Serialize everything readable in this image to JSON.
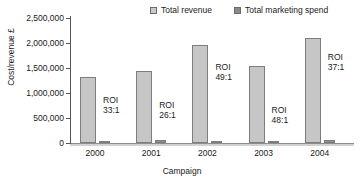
{
  "chart_data": {
    "type": "bar",
    "title": "",
    "xlabel": "Campaign",
    "ylabel": "Cost/revenue £",
    "categories": [
      "2000",
      "2001",
      "2002",
      "2003",
      "2004"
    ],
    "ylim": [
      0,
      2500000
    ],
    "y_ticks": [
      0,
      500000,
      1000000,
      1500000,
      2000000,
      2500000
    ],
    "y_tick_labels": [
      "0",
      "500,000",
      "1,000,000",
      "1,500,000",
      "2,000,000",
      "2,500,000"
    ],
    "grid": false,
    "legend_position": "top-right",
    "series": [
      {
        "name": "Total revenue",
        "color": "#c6c6c6",
        "values": [
          1320000,
          1440000,
          1960000,
          1550000,
          2100000
        ]
      },
      {
        "name": "Total marketing spend",
        "color": "#8d8d8d",
        "values": [
          40000,
          55000,
          40000,
          32000,
          57000
        ]
      }
    ],
    "annotations": [
      {
        "category": "2000",
        "line1": "ROI",
        "line2": "33:1"
      },
      {
        "category": "2001",
        "line1": "ROI",
        "line2": "26:1"
      },
      {
        "category": "2002",
        "line1": "ROI",
        "line2": "49:1"
      },
      {
        "category": "2003",
        "line1": "ROI",
        "line2": "48:1"
      },
      {
        "category": "2004",
        "line1": "ROI",
        "line2": "37:1"
      }
    ]
  },
  "legend": {
    "items": [
      {
        "label": "Total revenue"
      },
      {
        "label": "Total marketing spend"
      }
    ]
  },
  "axes": {
    "x_title": "Campaign",
    "y_title": "Cost/revenue £"
  }
}
